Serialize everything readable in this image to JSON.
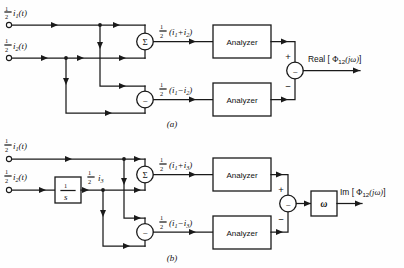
{
  "figure": {
    "background_color": "#fefefe",
    "line_color": "#1a1a1a"
  },
  "panels": [
    {
      "id": "a",
      "caption": "(a)",
      "inputs": [
        {
          "id": "in-i1",
          "label_frac": "1",
          "label_den": "2",
          "label_body": "i",
          "label_sub": "1",
          "label_tail": "(t)",
          "full": "½ i₁(t)"
        },
        {
          "id": "in-i2",
          "label_frac": "1",
          "label_den": "2",
          "label_body": "i",
          "label_sub": "2",
          "label_tail": "(t)",
          "full": "½ i₂(t)"
        }
      ],
      "operators": [
        {
          "id": "sum-junction",
          "symbol": "Σ",
          "name": "summer"
        },
        {
          "id": "diff-junction",
          "symbol": "−",
          "name": "subtractor"
        }
      ],
      "signals": [
        {
          "id": "sum-signal",
          "num": "1",
          "den": "2",
          "expr_a": "i",
          "sub_a": "1",
          "sign": "+",
          "expr_b": "i",
          "sub_b": "2",
          "full": "½ (i₁+i₂)"
        },
        {
          "id": "diff-signal",
          "num": "1",
          "den": "2",
          "expr_a": "i",
          "sub_a": "1",
          "sign": "−",
          "expr_b": "i",
          "sub_b": "2",
          "full": "½ (i₁−i₂)"
        }
      ],
      "blocks": [
        {
          "id": "analyzer-top",
          "label": "Analyzer"
        },
        {
          "id": "analyzer-bottom",
          "label": "Analyzer"
        }
      ],
      "combiner": {
        "id": "output-subtractor",
        "symbol": "−",
        "plus_sign": "+",
        "minus_sign": "−"
      },
      "output": {
        "id": "output-real",
        "prefix": "Real [ ",
        "phi": "Φ",
        "sub": "12",
        "arg": "(jω)",
        "suffix": "]",
        "full": "Real [ Φ₁₂(jω)]"
      }
    },
    {
      "id": "b",
      "caption": "(b)",
      "inputs": [
        {
          "id": "in-i1-b",
          "label_frac": "1",
          "label_den": "2",
          "label_body": "i",
          "label_sub": "1",
          "label_tail": "(t)",
          "full": "½ i₁(t)"
        },
        {
          "id": "in-i2-b",
          "label_frac": "1",
          "label_den": "2",
          "label_body": "i",
          "label_sub": "2",
          "label_tail": "(t)",
          "full": "½ i₂(t)"
        }
      ],
      "integrator": {
        "id": "integrator-block",
        "num": "1",
        "den": "s",
        "full": "1/s"
      },
      "integrator_output": {
        "id": "i3-signal",
        "num": "1",
        "den": "2",
        "body": "i",
        "sub": "3",
        "full": "½ i₃"
      },
      "operators": [
        {
          "id": "sum-junction-b",
          "symbol": "Σ",
          "name": "summer"
        },
        {
          "id": "diff-junction-b",
          "symbol": "−",
          "name": "subtractor"
        }
      ],
      "signals": [
        {
          "id": "sum-signal-b",
          "num": "1",
          "den": "2",
          "expr_a": "i",
          "sub_a": "1",
          "sign": "+",
          "expr_b": "i",
          "sub_b": "3",
          "full": "½ (i₁+i₃)"
        },
        {
          "id": "diff-signal-b",
          "num": "1",
          "den": "2",
          "expr_a": "i",
          "sub_a": "1",
          "sign": "−",
          "expr_b": "i",
          "sub_b": "3",
          "full": "½ (i₁−i₃)"
        }
      ],
      "blocks": [
        {
          "id": "analyzer-top-b",
          "label": "Analyzer"
        },
        {
          "id": "analyzer-bottom-b",
          "label": "Analyzer"
        }
      ],
      "combiner": {
        "id": "output-subtractor-b",
        "symbol": "−",
        "plus_sign": "+",
        "minus_sign": "−"
      },
      "gain": {
        "id": "omega-block",
        "label": "ω"
      },
      "output": {
        "id": "output-imag",
        "prefix": "Im [ ",
        "phi": "Φ",
        "sub": "12",
        "arg": "(jω)",
        "suffix": "]",
        "full": "Im [ Φ₁₂(jω)]"
      }
    }
  ]
}
